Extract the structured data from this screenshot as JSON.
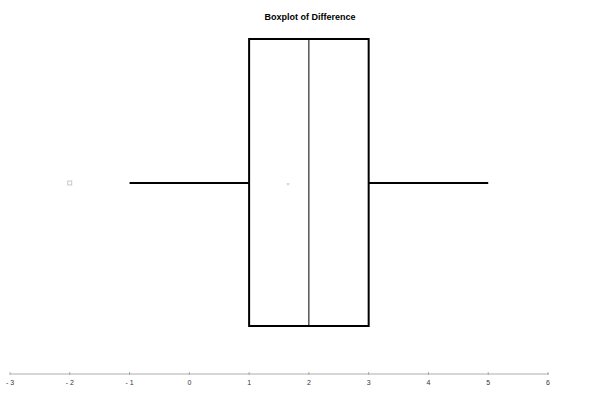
{
  "chart_data": {
    "type": "boxplot",
    "title": "Boxplot of Difference",
    "xlabel": "",
    "ylabel": "",
    "orientation": "horizontal",
    "xlim": [
      -3,
      6
    ],
    "ticks": [
      -3,
      -2,
      -1,
      0,
      1,
      2,
      3,
      4,
      5,
      6
    ],
    "tick_labels": [
      "- 3",
      "- 2",
      "- 1",
      "0",
      "1",
      "2",
      "3",
      "4",
      "5",
      "6"
    ],
    "grid": false,
    "legend": null,
    "box": {
      "whisker_low": -1,
      "q1": 1,
      "median": 2,
      "q3": 3,
      "whisker_high": 5,
      "mean": 1.65,
      "outliers": [
        -2
      ]
    },
    "colors": {
      "box_stroke": "#000000",
      "axis": "#999999",
      "markers": "#bbbbbb"
    }
  }
}
